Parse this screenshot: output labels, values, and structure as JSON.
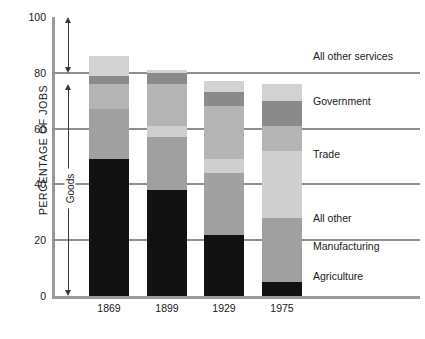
{
  "chart_data": {
    "type": "bar",
    "subtype": "stacked-bar-100",
    "title": "",
    "xlabel": "",
    "ylabel": "PERCENTAGE OF JOBS",
    "ylim": [
      0,
      100
    ],
    "yticks": [
      0,
      20,
      40,
      60,
      80,
      100
    ],
    "ytick_labels": [
      "0",
      "20",
      "40",
      "60",
      "80",
      "100"
    ],
    "grid": true,
    "grid_axis": "y",
    "legend_position": "right-inline-labels",
    "categories": [
      "1869",
      "1899",
      "1929",
      "1975"
    ],
    "series": [
      {
        "name": "Agriculture",
        "color": "#121212",
        "values": [
          49,
          38,
          22,
          5
        ]
      },
      {
        "name": "Manufacturing",
        "color": "#a0a0a0",
        "values": [
          18,
          19,
          22,
          23
        ]
      },
      {
        "name": "All other",
        "color": "#cfcfcf",
        "values": [
          0,
          4,
          5,
          24
        ]
      },
      {
        "name": "Trade",
        "color": "#b4b4b4",
        "values": [
          9,
          15,
          19,
          9
        ]
      },
      {
        "name": "Government",
        "color": "#8a8a8a",
        "values": [
          3,
          4,
          5,
          9
        ]
      },
      {
        "name": "All other services",
        "color": "#d2d2d2",
        "values": [
          7,
          1,
          4,
          6
        ]
      }
    ],
    "annotations": [
      {
        "name": "goods-bracket",
        "label": "Goods",
        "from_value": 0,
        "to_value": 76,
        "note": "double-headed vertical arrow spanning goods-producing share"
      },
      {
        "name": "services-bracket",
        "label": "",
        "from_value": 80,
        "to_value": 100,
        "note": "double-headed vertical arrow spanning services share"
      }
    ],
    "series_label_positions": [
      {
        "label": "All other services",
        "at_value": 86
      },
      {
        "label": "Government",
        "at_value": 70
      },
      {
        "label": "Trade",
        "at_value": 51
      },
      {
        "label": "All other",
        "at_value": 28
      },
      {
        "label": "Manufacturing",
        "at_value": 18
      },
      {
        "label": "Agriculture",
        "at_value": 7
      }
    ]
  },
  "colors": {
    "background": "#ffffff",
    "axis": "#9a9a9a",
    "gridline": "#8f8f8f",
    "text": "#1a1a1a",
    "annotation": "#3a3a3a"
  }
}
